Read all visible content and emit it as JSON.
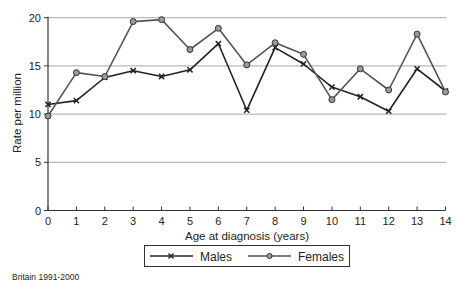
{
  "chart_data": {
    "type": "line",
    "title": "",
    "xlabel": "Age at diagnosis (years)",
    "ylabel": "Rate per million",
    "x": [
      0,
      1,
      2,
      3,
      4,
      5,
      6,
      7,
      8,
      9,
      10,
      11,
      12,
      13,
      14
    ],
    "xlim": [
      0,
      14
    ],
    "ylim": [
      0,
      20
    ],
    "yticks": [
      0,
      5,
      10,
      15,
      20
    ],
    "xticks": [
      0,
      1,
      2,
      3,
      4,
      5,
      6,
      7,
      8,
      9,
      10,
      11,
      12,
      13,
      14
    ],
    "grid": "horizontal",
    "legend_position": "bottom",
    "series": [
      {
        "name": "Males",
        "marker": "x",
        "color": "#222222",
        "values": [
          11.0,
          11.4,
          13.8,
          14.5,
          13.9,
          14.6,
          17.3,
          10.4,
          16.9,
          15.2,
          12.8,
          11.8,
          10.3,
          14.7,
          12.4
        ]
      },
      {
        "name": "Females",
        "marker": "circle",
        "color": "#555555",
        "values": [
          9.8,
          14.3,
          13.9,
          19.6,
          19.8,
          16.7,
          18.9,
          15.1,
          17.4,
          16.2,
          11.5,
          14.7,
          12.5,
          18.3,
          12.3
        ]
      }
    ]
  },
  "legend": {
    "males_label": "Males",
    "females_label": "Females"
  },
  "axes": {
    "xlabel": "Age at diagnosis (years)",
    "ylabel": "Rate per million"
  },
  "footer": {
    "source": "Britain 1991-2000"
  }
}
